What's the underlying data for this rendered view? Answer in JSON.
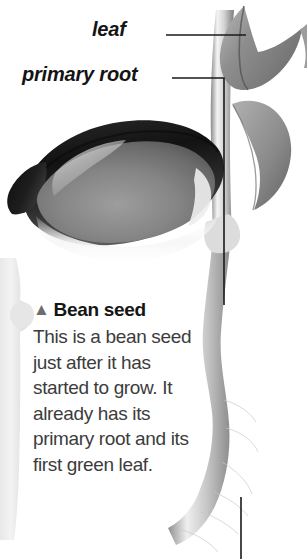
{
  "page": {
    "background_color": "#ffffff",
    "width": 307,
    "height": 559,
    "style": "grayscale botanical illustration"
  },
  "callouts": [
    {
      "id": "leaf",
      "label": "leaf",
      "leader": "horizontal line from label to leaf at top of stem"
    },
    {
      "id": "primary-root",
      "label": "primary root",
      "leader": "horizontal line turning down vertically to the root"
    }
  ],
  "caption": {
    "marker": "▲",
    "marker_name": "up-triangle-marker",
    "marker_color": "#6d6d6d",
    "heading": "Bean seed",
    "body": "This is a bean seed just after it has started to grow. It already has its primary root and its first green leaf.",
    "body_lines": [
      "This is a bean",
      "seed just after",
      "it has started to",
      "grow. It already",
      "has its primary",
      "root and its",
      "first green leaf."
    ],
    "heading_color": "#151515",
    "body_color": "#3c3c3c"
  },
  "illustration": {
    "subject": "germinating bean seed",
    "parts": [
      {
        "name": "bean-seed-cotyledon",
        "description": "large ellipse, dark gray to black rim with mid-gray body and white highlight"
      },
      {
        "name": "upper-leaf",
        "description": "gray leaf at top right, folded"
      },
      {
        "name": "lower-leaf",
        "description": "gray pointed ovate leaf on right side of stem"
      },
      {
        "name": "stem",
        "description": "pale gray vertical stem rising from the seed"
      },
      {
        "name": "primary-root",
        "description": "long pale gray root descending and curving left at the bottom"
      },
      {
        "name": "root-hairs",
        "description": "fine hairline strands along the lower root"
      },
      {
        "name": "left-edge-root",
        "description": "faint light gray root fragment bleeding in from the left edge"
      }
    ],
    "colors": {
      "seed_dark": "#1b1b1b",
      "seed_mid": "#7b7b7b",
      "seed_highlight": "#e8e8e8",
      "leaf_gray": "#9a9a9a",
      "stem_gray": "#c9c9c9",
      "root_gray": "#b9b9b9",
      "leader_line": "#1a1a1a"
    }
  }
}
